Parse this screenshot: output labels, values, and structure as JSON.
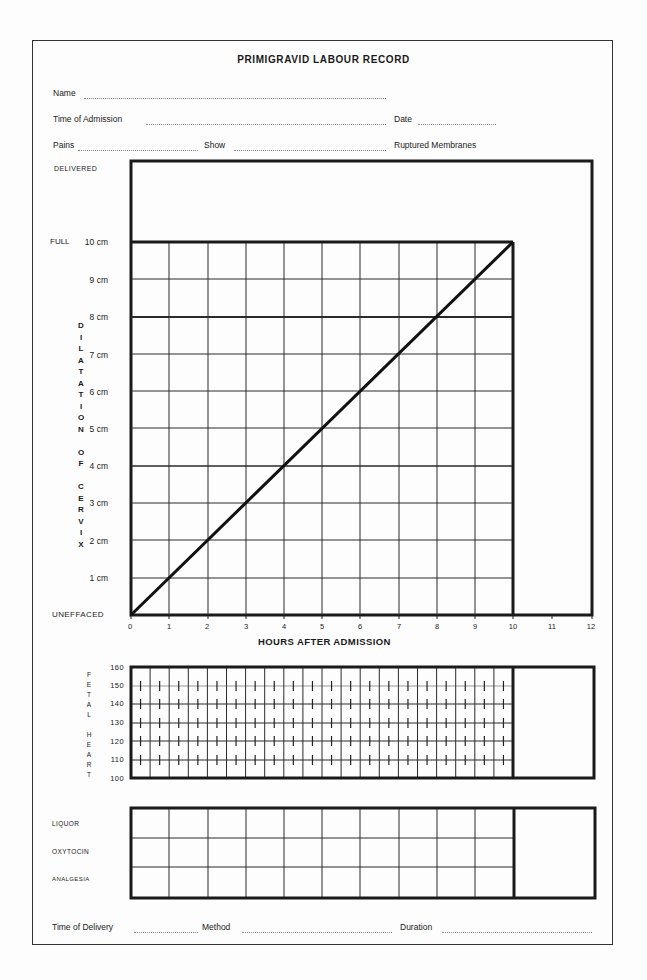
{
  "form": {
    "title": "PRIMIGRAVID LABOUR RECORD",
    "fields": {
      "name_label": "Name",
      "admission_label": "Time of Admission",
      "date_label": "Date",
      "pains_label": "Pains",
      "show_label": "Show",
      "membranes_label": "Ruptured Membranes"
    },
    "footer": {
      "delivery_label": "Time of Delivery",
      "method_label": "Method",
      "duration_label": "Duration"
    }
  },
  "partogram": {
    "delivered_label": "DELIVERED",
    "full_label": "FULL",
    "uneffaced_label": "UNEFFACED",
    "y_axis_title": "DILATATION OF CERVIX",
    "y_ticks": [
      "10 cm",
      "9 cm",
      "8 cm",
      "7 cm",
      "6 cm",
      "5 cm",
      "4 cm",
      "3 cm",
      "2 cm",
      "1 cm"
    ],
    "x_ticks": [
      "0",
      "1",
      "2",
      "3",
      "4",
      "5",
      "6",
      "7",
      "8",
      "9",
      "10",
      "11",
      "12"
    ],
    "x_axis_title": "HOURS AFTER ADMISSION",
    "expected_line": {
      "from_hour": 0,
      "from_cm": 0,
      "to_hour": 10,
      "to_cm": 10
    }
  },
  "fetal_heart": {
    "title": "FETAL HEART",
    "y_ticks": [
      "160",
      "150",
      "140",
      "130",
      "120",
      "110",
      "100"
    ]
  },
  "chart_rows": {
    "labels": [
      "LIQUOR",
      "OXYTOCIN",
      "ANALGESIA"
    ]
  },
  "chart_data": {
    "type": "line",
    "title": "PRIMIGRAVID LABOUR RECORD",
    "xlabel": "HOURS AFTER ADMISSION",
    "ylabel": "DILATATION OF CERVIX",
    "x": [
      0,
      1,
      2,
      3,
      4,
      5,
      6,
      7,
      8,
      9,
      10
    ],
    "series": [
      {
        "name": "Expected dilatation (1 cm/hour)",
        "values": [
          0,
          1,
          2,
          3,
          4,
          5,
          6,
          7,
          8,
          9,
          10
        ]
      }
    ],
    "xlim": [
      0,
      12
    ],
    "ylim": [
      0,
      10
    ],
    "grid": true
  }
}
